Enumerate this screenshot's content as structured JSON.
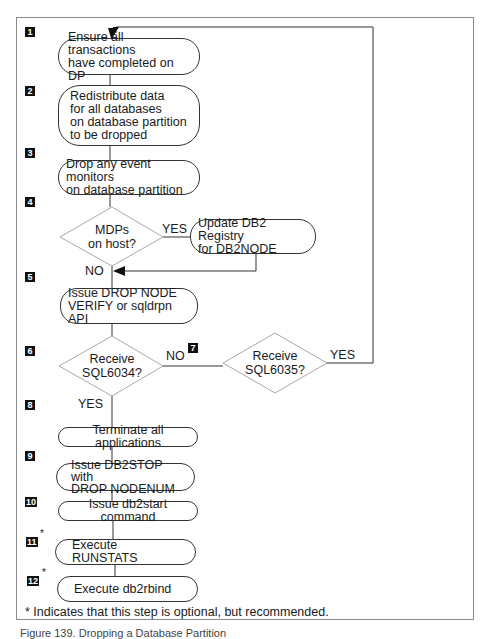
{
  "diagram": {
    "steps": [
      {
        "badge": "1",
        "text": "Ensure all transactions\nhave completed on DP"
      },
      {
        "badge": "2",
        "text": "Redistribute data\nfor all databases\non database partition\nto be dropped"
      },
      {
        "badge": "3",
        "text": "Drop any event monitors\non database partition"
      },
      {
        "badge": "4",
        "text": "MDPs\non host?"
      },
      {
        "badge": "4b",
        "text": "Update DB2 Registry\nfor DB2NODE"
      },
      {
        "badge": "5",
        "text": "Issue DROP NODE\nVERIFY or sqldrpn API"
      },
      {
        "badge": "6",
        "text": "Receive\nSQL6034?"
      },
      {
        "badge": "7",
        "text": "Receive\nSQL6035?"
      },
      {
        "badge": "8",
        "text": "Terminate all applications"
      },
      {
        "badge": "9",
        "text": "Issue DB2STOP with\nDROP NODENUM"
      },
      {
        "badge": "10",
        "text": "Issue db2start command"
      },
      {
        "badge": "11",
        "text": "Execute RUNSTATS",
        "optional": true
      },
      {
        "badge": "12",
        "text": "Execute db2rbind",
        "optional": true
      }
    ],
    "badges": [
      "1",
      "2",
      "3",
      "4",
      "5",
      "6",
      "7",
      "8",
      "9",
      "10",
      "11",
      "12"
    ],
    "labels": {
      "d4_yes": "YES",
      "d4_no": "NO",
      "d6_no": "NO",
      "d6_yes": "YES",
      "d7_yes": "YES"
    },
    "optional_marker": "*",
    "footnote": "* Indicates that this step is optional, but recommended.",
    "caption": "Figure 139. Dropping a Database Partition"
  }
}
